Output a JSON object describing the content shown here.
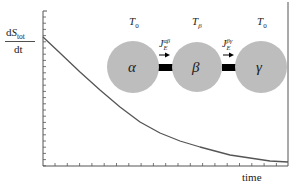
{
  "figure": {
    "ylabel": {
      "numerator_d": "d",
      "numerator_S": "S",
      "numerator_sub": "tot",
      "denominator": "dt"
    },
    "xlabel": "time",
    "colors": {
      "axis": "#555555",
      "curve": "#555555",
      "circle_fill": "#bdbdbd",
      "connector": "#000000",
      "text": "#222222"
    },
    "reservoirs": [
      {
        "id": "alpha",
        "symbol": "α",
        "temperature_label": "T",
        "temperature_sub": "0"
      },
      {
        "id": "beta",
        "symbol": "β",
        "temperature_label": "T",
        "temperature_sub": "β"
      },
      {
        "id": "gamma",
        "symbol": "γ",
        "temperature_label": "T",
        "temperature_sub": "0"
      }
    ],
    "currents": [
      {
        "id": "J_alpha_beta",
        "label": "J",
        "sub": "E",
        "sup": "αβ",
        "direction": "right"
      },
      {
        "id": "J_beta_gamma",
        "label": "J",
        "sub": "E",
        "sup": "βγ",
        "direction": "right"
      }
    ],
    "curve": {
      "description": "monotonic decay of entropy production rate over time",
      "points_px": [
        [
          43,
          37
        ],
        [
          60,
          53
        ],
        [
          80,
          72
        ],
        [
          100,
          90
        ],
        [
          120,
          107
        ],
        [
          140,
          122
        ],
        [
          160,
          133
        ],
        [
          180,
          141
        ],
        [
          200,
          147
        ],
        [
          215,
          151
        ],
        [
          230,
          155
        ],
        [
          250,
          158
        ],
        [
          270,
          161
        ],
        [
          288,
          162
        ]
      ]
    }
  }
}
